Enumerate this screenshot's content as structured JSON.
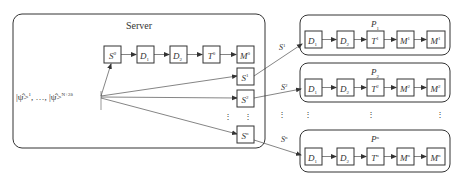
{
  "server": {
    "title": "Server",
    "input_label": {
      "first": "|ψ̂>",
      "first_sup": "1",
      "sep": ", …, ",
      "last": "|ψ̂>",
      "last_sup": "N+2δ"
    },
    "chain": [
      {
        "base": "S",
        "sup": "0",
        "sub": ""
      },
      {
        "base": "D",
        "sup": "",
        "sub": "1"
      },
      {
        "base": "D",
        "sup": "",
        "sub": "2"
      },
      {
        "base": "T",
        "sup": "0",
        "sub": ""
      },
      {
        "base": "M",
        "sup": "0",
        "sub": ""
      }
    ],
    "outputs": [
      {
        "base": "S",
        "sup": "1"
      },
      {
        "base": "S",
        "sup": "2"
      },
      {
        "base": "S",
        "sup": "n"
      }
    ],
    "ellipsis": "⋮"
  },
  "edges": [
    {
      "base": "S",
      "sup": "1"
    },
    {
      "base": "S",
      "sup": "2"
    },
    {
      "base": "S",
      "sup": "n"
    }
  ],
  "participants": [
    {
      "title_base": "P",
      "title_sub": "1",
      "title_sup": "",
      "chain": [
        {
          "base": "D",
          "sup": "",
          "sub": "1"
        },
        {
          "base": "D",
          "sup": "",
          "sub": "2"
        },
        {
          "base": "T",
          "sup": "1",
          "sub": ""
        },
        {
          "base": "M",
          "sup": "1",
          "sub": ""
        },
        {
          "base": "M",
          "sup": "1",
          "sub": ""
        }
      ]
    },
    {
      "title_base": "P",
      "title_sub": "2",
      "title_sup": "",
      "chain": [
        {
          "base": "D",
          "sup": "",
          "sub": "1"
        },
        {
          "base": "D",
          "sup": "",
          "sub": "2"
        },
        {
          "base": "T",
          "sup": "2",
          "sub": ""
        },
        {
          "base": "M",
          "sup": "2",
          "sub": ""
        },
        {
          "base": "M",
          "sup": "2",
          "sub": ""
        }
      ]
    },
    {
      "title_base": "P",
      "title_sub": "",
      "title_sup": "n",
      "chain": [
        {
          "base": "D",
          "sup": "",
          "sub": "1"
        },
        {
          "base": "D",
          "sup": "",
          "sub": "2"
        },
        {
          "base": "T",
          "sup": "n",
          "sub": ""
        },
        {
          "base": "M",
          "sup": "n",
          "sub": ""
        },
        {
          "base": "M",
          "sup": "n",
          "sub": ""
        }
      ]
    }
  ],
  "colors": {
    "stroke": "#333333",
    "background": "#ffffff"
  }
}
